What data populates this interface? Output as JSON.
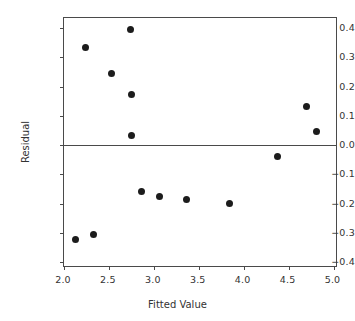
{
  "chart_data": {
    "type": "scatter",
    "title": "",
    "xlabel": "Fitted Value",
    "ylabel": "Residual",
    "xlim": [
      2.0,
      5.05
    ],
    "ylim": [
      -0.42,
      0.435
    ],
    "grid": false,
    "legend": null,
    "xticks": [
      "2.0",
      "2.5",
      "3.0",
      "3.5",
      "4.0",
      "4.5",
      "5.0"
    ],
    "xtick_values": [
      2.0,
      2.5,
      3.0,
      3.5,
      4.0,
      4.5,
      5.0
    ],
    "yticks": [
      "0.4",
      "0.3",
      "0.2",
      "0.1",
      "0.0",
      "-0.1",
      "-0.2",
      "-0.3",
      "-0.4"
    ],
    "ytick_values": [
      0.4,
      0.3,
      0.2,
      0.1,
      0.0,
      -0.1,
      -0.2,
      -0.3,
      -0.4
    ],
    "reference_line": {
      "orientation": "horizontal",
      "value": 0.0
    },
    "marker": {
      "shape": "circle",
      "color": "#1c1c1c",
      "size": 7
    },
    "points": [
      {
        "x": 2.13,
        "y": -0.322
      },
      {
        "x": 2.24,
        "y": 0.335
      },
      {
        "x": 2.33,
        "y": -0.305
      },
      {
        "x": 2.53,
        "y": 0.245
      },
      {
        "x": 2.74,
        "y": 0.395
      },
      {
        "x": 2.75,
        "y": 0.172
      },
      {
        "x": 2.75,
        "y": 0.033
      },
      {
        "x": 2.86,
        "y": -0.158
      },
      {
        "x": 3.06,
        "y": -0.175
      },
      {
        "x": 3.36,
        "y": -0.186
      },
      {
        "x": 3.84,
        "y": -0.2
      },
      {
        "x": 4.38,
        "y": -0.037
      },
      {
        "x": 4.7,
        "y": 0.131
      },
      {
        "x": 4.81,
        "y": 0.048
      }
    ]
  },
  "axes": {
    "frame_color": "#4a4a4a",
    "text_color": "#333333"
  }
}
